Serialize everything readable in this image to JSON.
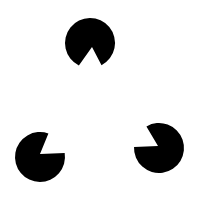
{
  "figure": {
    "background": "#ffffff",
    "fill": "#000000",
    "pacmen": [
      {
        "name": "top",
        "cx": 90,
        "cy": 43,
        "r": 25,
        "apex": [
          92,
          47
        ],
        "edge1": [
          77,
          68
        ],
        "edge2": [
          103,
          68
        ]
      },
      {
        "name": "bottom-left",
        "cx": 40,
        "cy": 157,
        "r": 25,
        "apex": [
          40,
          154
        ],
        "edge1": [
          49,
          132
        ],
        "edge2": [
          66,
          153
        ]
      },
      {
        "name": "bottom-right",
        "cx": 159,
        "cy": 148,
        "r": 25,
        "apex": [
          158,
          146
        ],
        "edge1": [
          145,
          124
        ],
        "edge2": [
          134,
          147
        ]
      }
    ]
  }
}
